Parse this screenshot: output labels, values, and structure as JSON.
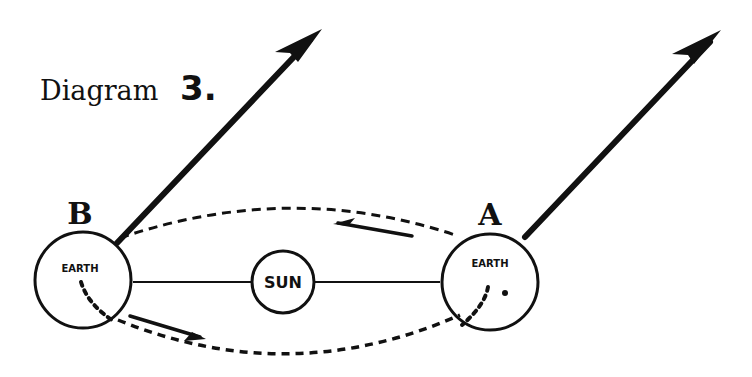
{
  "diagram": {
    "title": "Diagram",
    "number": "3.",
    "sun": {
      "label": "SUN"
    },
    "positions": [
      {
        "id": "B",
        "label": "B",
        "body_label": "EARTH"
      },
      {
        "id": "A",
        "label": "A",
        "body_label": "EARTH"
      }
    ],
    "elements": {
      "axis_arrows": 2,
      "orbit": "dashed ellipse",
      "direction_arrows": 2
    },
    "colors": {
      "ink": "#111111",
      "paper": "#ffffff"
    }
  }
}
